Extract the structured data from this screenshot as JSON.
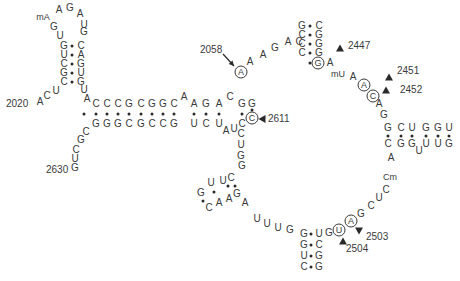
{
  "diagram": {
    "type": "rRNA secondary structure (peptidyl transferase loop region)",
    "ink_color": "#3a3a3a",
    "nucleotides": [
      {
        "t": "mA",
        "x": 43,
        "y": 17,
        "k": "mod"
      },
      {
        "t": "A",
        "x": 59,
        "y": 10
      },
      {
        "t": "G",
        "x": 70,
        "y": 8
      },
      {
        "t": "A",
        "x": 80,
        "y": 14
      },
      {
        "t": "U",
        "x": 84,
        "y": 25
      },
      {
        "t": "G",
        "x": 54,
        "y": 27
      },
      {
        "t": "U",
        "x": 60,
        "y": 36
      },
      {
        "t": "G",
        "x": 84,
        "y": 32
      },
      {
        "t": "G",
        "x": 64,
        "y": 46
      },
      {
        "t": "U",
        "x": 64,
        "y": 55
      },
      {
        "t": "C",
        "x": 64,
        "y": 64
      },
      {
        "t": "G",
        "x": 64,
        "y": 73
      },
      {
        "t": "C",
        "x": 64,
        "y": 82
      },
      {
        "t": "C",
        "x": 81,
        "y": 46
      },
      {
        "t": "A",
        "x": 81,
        "y": 55
      },
      {
        "t": "G",
        "x": 81,
        "y": 64
      },
      {
        "t": "U",
        "x": 81,
        "y": 73
      },
      {
        "t": "G",
        "x": 81,
        "y": 82
      },
      {
        "t": "A",
        "x": 40,
        "y": 102
      },
      {
        "t": "C",
        "x": 47,
        "y": 96
      },
      {
        "t": "U",
        "x": 56,
        "y": 91
      },
      {
        "t": "U",
        "x": 84,
        "y": 90
      },
      {
        "t": "A",
        "x": 87,
        "y": 99
      },
      {
        "t": "C",
        "x": 96,
        "y": 104
      },
      {
        "t": "C",
        "x": 107,
        "y": 104
      },
      {
        "t": "C",
        "x": 118,
        "y": 104
      },
      {
        "t": "G",
        "x": 129,
        "y": 104
      },
      {
        "t": "C",
        "x": 141,
        "y": 104
      },
      {
        "t": "G",
        "x": 152,
        "y": 104
      },
      {
        "t": "G",
        "x": 163,
        "y": 104
      },
      {
        "t": "C",
        "x": 174,
        "y": 104
      },
      {
        "t": "A",
        "x": 184,
        "y": 97
      },
      {
        "t": "A",
        "x": 194,
        "y": 104
      },
      {
        "t": "G",
        "x": 206,
        "y": 104
      },
      {
        "t": "A",
        "x": 219,
        "y": 104
      },
      {
        "t": "C",
        "x": 230,
        "y": 97
      },
      {
        "t": "G",
        "x": 242,
        "y": 104
      },
      {
        "t": "G",
        "x": 252,
        "y": 104
      },
      {
        "t": "G",
        "x": 96,
        "y": 124
      },
      {
        "t": "G",
        "x": 107,
        "y": 124
      },
      {
        "t": "G",
        "x": 118,
        "y": 124
      },
      {
        "t": "C",
        "x": 129,
        "y": 124
      },
      {
        "t": "G",
        "x": 141,
        "y": 124
      },
      {
        "t": "C",
        "x": 152,
        "y": 124
      },
      {
        "t": "C",
        "x": 163,
        "y": 124
      },
      {
        "t": "G",
        "x": 174,
        "y": 124
      },
      {
        "t": "U",
        "x": 194,
        "y": 124
      },
      {
        "t": "C",
        "x": 206,
        "y": 124
      },
      {
        "t": "U",
        "x": 219,
        "y": 124
      },
      {
        "t": "A",
        "x": 226,
        "y": 131
      },
      {
        "t": "U",
        "x": 234,
        "y": 129
      },
      {
        "t": "C",
        "x": 242,
        "y": 124
      },
      {
        "t": "C",
        "x": 86,
        "y": 132
      },
      {
        "t": "G",
        "x": 81,
        "y": 140
      },
      {
        "t": "C",
        "x": 76,
        "y": 150
      },
      {
        "t": "U",
        "x": 75,
        "y": 159
      },
      {
        "t": "G",
        "x": 75,
        "y": 168
      },
      {
        "t": "A",
        "x": 241,
        "y": 72,
        "k": "circ"
      },
      {
        "t": "A",
        "x": 250,
        "y": 62
      },
      {
        "t": "A",
        "x": 263,
        "y": 55
      },
      {
        "t": "G",
        "x": 275,
        "y": 48
      },
      {
        "t": "A",
        "x": 288,
        "y": 42
      },
      {
        "t": "C",
        "x": 299,
        "y": 42
      },
      {
        "t": "G",
        "x": 302,
        "y": 26
      },
      {
        "t": "C",
        "x": 302,
        "y": 35
      },
      {
        "t": "C",
        "x": 302,
        "y": 44
      },
      {
        "t": "C",
        "x": 302,
        "y": 53
      },
      {
        "t": "C",
        "x": 319,
        "y": 26
      },
      {
        "t": "G",
        "x": 319,
        "y": 35
      },
      {
        "t": "G",
        "x": 319,
        "y": 44
      },
      {
        "t": "G",
        "x": 319,
        "y": 53
      },
      {
        "t": "G",
        "x": 318,
        "y": 63,
        "k": "circ"
      },
      {
        "t": "A",
        "x": 330,
        "y": 63
      },
      {
        "t": "mU",
        "x": 338,
        "y": 74,
        "k": "mod"
      },
      {
        "t": "A",
        "x": 353,
        "y": 77
      },
      {
        "t": "A",
        "x": 364,
        "y": 85,
        "k": "circ"
      },
      {
        "t": "C",
        "x": 373,
        "y": 96,
        "k": "circ"
      },
      {
        "t": "A",
        "x": 379,
        "y": 104
      },
      {
        "t": "G",
        "x": 384,
        "y": 115
      },
      {
        "t": "G",
        "x": 388,
        "y": 128
      },
      {
        "t": "C",
        "x": 401,
        "y": 128
      },
      {
        "t": "U",
        "x": 412,
        "y": 128
      },
      {
        "t": "G",
        "x": 426,
        "y": 128
      },
      {
        "t": "G",
        "x": 438,
        "y": 128
      },
      {
        "t": "U",
        "x": 449,
        "y": 128
      },
      {
        "t": "C",
        "x": 388,
        "y": 144
      },
      {
        "t": "G",
        "x": 401,
        "y": 144
      },
      {
        "t": "G",
        "x": 412,
        "y": 144
      },
      {
        "t": "U",
        "x": 419,
        "y": 151
      },
      {
        "t": "U",
        "x": 426,
        "y": 144
      },
      {
        "t": "U",
        "x": 438,
        "y": 144
      },
      {
        "t": "G",
        "x": 449,
        "y": 144
      },
      {
        "t": "A",
        "x": 391,
        "y": 158
      },
      {
        "t": "Cm",
        "x": 390,
        "y": 177,
        "k": "mod"
      },
      {
        "t": "C",
        "x": 386,
        "y": 190
      },
      {
        "t": "U",
        "x": 379,
        "y": 198
      },
      {
        "t": "C",
        "x": 371,
        "y": 206
      },
      {
        "t": "G",
        "x": 361,
        "y": 214
      },
      {
        "t": "A",
        "x": 351,
        "y": 221,
        "k": "circ"
      },
      {
        "t": "U",
        "x": 339,
        "y": 230,
        "k": "circ"
      },
      {
        "t": "G",
        "x": 329,
        "y": 233
      },
      {
        "t": "G",
        "x": 304,
        "y": 234
      },
      {
        "t": "G",
        "x": 304,
        "y": 245
      },
      {
        "t": "U",
        "x": 304,
        "y": 256
      },
      {
        "t": "C",
        "x": 304,
        "y": 267
      },
      {
        "t": "U",
        "x": 319,
        "y": 234
      },
      {
        "t": "C",
        "x": 319,
        "y": 245
      },
      {
        "t": "G",
        "x": 319,
        "y": 256
      },
      {
        "t": "G",
        "x": 319,
        "y": 267
      },
      {
        "t": "G",
        "x": 290,
        "y": 230
      },
      {
        "t": "U",
        "x": 278,
        "y": 228
      },
      {
        "t": "U",
        "x": 267,
        "y": 224
      },
      {
        "t": "U",
        "x": 257,
        "y": 219
      },
      {
        "t": "A",
        "x": 245,
        "y": 203
      },
      {
        "t": "C",
        "x": 241,
        "y": 134
      },
      {
        "t": "U",
        "x": 241,
        "y": 145
      },
      {
        "t": "G",
        "x": 241,
        "y": 156
      },
      {
        "t": "G",
        "x": 242,
        "y": 166
      },
      {
        "t": "C",
        "x": 231,
        "y": 178
      },
      {
        "t": "U",
        "x": 223,
        "y": 181
      },
      {
        "t": "U",
        "x": 211,
        "y": 183
      },
      {
        "t": "G",
        "x": 201,
        "y": 193
      },
      {
        "t": "C",
        "x": 209,
        "y": 208
      },
      {
        "t": "A",
        "x": 219,
        "y": 203
      },
      {
        "t": "A",
        "x": 229,
        "y": 199
      },
      {
        "t": "G",
        "x": 237,
        "y": 194
      },
      {
        "t": "C",
        "x": 252,
        "y": 118,
        "k": "circ"
      }
    ],
    "pair_dots": [
      [
        72,
        46
      ],
      [
        72,
        55
      ],
      [
        72,
        64
      ],
      [
        72,
        73
      ],
      [
        72,
        82
      ],
      [
        96,
        114
      ],
      [
        107,
        114
      ],
      [
        118,
        114
      ],
      [
        129,
        114
      ],
      [
        141,
        114
      ],
      [
        152,
        114
      ],
      [
        163,
        114
      ],
      [
        174,
        114
      ],
      [
        194,
        114
      ],
      [
        206,
        114
      ],
      [
        219,
        114
      ],
      [
        242,
        114
      ],
      [
        252,
        110
      ],
      [
        310,
        26
      ],
      [
        310,
        35
      ],
      [
        310,
        44
      ],
      [
        310,
        53
      ],
      [
        310,
        63
      ],
      [
        388,
        136
      ],
      [
        401,
        136
      ],
      [
        412,
        136
      ],
      [
        426,
        136
      ],
      [
        438,
        136
      ],
      [
        449,
        136
      ],
      [
        311,
        234
      ],
      [
        311,
        245
      ],
      [
        311,
        256
      ],
      [
        311,
        267
      ],
      [
        203,
        201
      ],
      [
        214,
        192
      ],
      [
        228,
        186
      ],
      [
        235,
        186
      ],
      [
        84,
        114
      ]
    ],
    "position_labels": [
      {
        "text": "2020",
        "x": 6,
        "y": 104
      },
      {
        "text": "2630",
        "x": 46,
        "y": 170
      },
      {
        "text": "2058",
        "x": 200,
        "y": 50
      },
      {
        "text": "2611",
        "x": 268,
        "y": 119
      },
      {
        "text": "2447",
        "x": 348,
        "y": 46
      },
      {
        "text": "2451",
        "x": 397,
        "y": 71
      },
      {
        "text": "2452",
        "x": 400,
        "y": 90
      },
      {
        "text": "2503",
        "x": 366,
        "y": 237
      },
      {
        "text": "2504",
        "x": 346,
        "y": 249
      }
    ],
    "arrows": [
      {
        "dir": "left",
        "x": 262,
        "y": 119,
        "label": "2611"
      },
      {
        "dir": "up",
        "x": 340,
        "y": 48,
        "label": "2447"
      },
      {
        "dir": "up",
        "x": 389,
        "y": 77,
        "label": "2451"
      },
      {
        "dir": "up",
        "x": 386,
        "y": 90,
        "label": "2452"
      },
      {
        "dir": "down",
        "x": 359,
        "y": 231,
        "label": "2503"
      },
      {
        "dir": "up",
        "x": 343,
        "y": 241,
        "label": "2504"
      }
    ],
    "leader_lines": [
      {
        "x1": 223,
        "y1": 54,
        "x2": 234,
        "y2": 66,
        "label": "2058"
      }
    ]
  }
}
